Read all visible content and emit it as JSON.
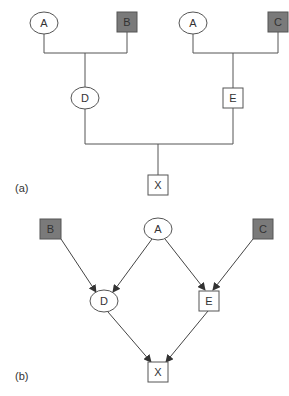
{
  "diagram_a": {
    "caption": "(a)",
    "nodes": {
      "a1": {
        "label": "A",
        "shape": "ellipse",
        "fill": "#ffffff"
      },
      "b": {
        "label": "B",
        "shape": "box",
        "fill": "#7a7a7a"
      },
      "a2": {
        "label": "A",
        "shape": "ellipse",
        "fill": "#ffffff"
      },
      "c": {
        "label": "C",
        "shape": "box",
        "fill": "#7a7a7a"
      },
      "d": {
        "label": "D",
        "shape": "ellipse",
        "fill": "#ffffff"
      },
      "e": {
        "label": "E",
        "shape": "box",
        "fill": "#ffffff"
      },
      "x": {
        "label": "X",
        "shape": "box",
        "fill": "#ffffff"
      }
    },
    "edges": [
      [
        "A",
        "D"
      ],
      [
        "B",
        "D"
      ],
      [
        "A",
        "E"
      ],
      [
        "C",
        "E"
      ],
      [
        "D",
        "X"
      ],
      [
        "E",
        "X"
      ]
    ]
  },
  "diagram_b": {
    "caption": "(b)",
    "nodes": {
      "b": {
        "label": "B",
        "shape": "box",
        "fill": "#7a7a7a"
      },
      "a": {
        "label": "A",
        "shape": "ellipse",
        "fill": "#ffffff"
      },
      "c": {
        "label": "C",
        "shape": "box",
        "fill": "#7a7a7a"
      },
      "d": {
        "label": "D",
        "shape": "ellipse",
        "fill": "#ffffff"
      },
      "e": {
        "label": "E",
        "shape": "box",
        "fill": "#ffffff"
      },
      "x": {
        "label": "X",
        "shape": "box",
        "fill": "#ffffff"
      }
    },
    "edges": [
      [
        "B",
        "D"
      ],
      [
        "A",
        "D"
      ],
      [
        "A",
        "E"
      ],
      [
        "C",
        "E"
      ],
      [
        "D",
        "X"
      ],
      [
        "E",
        "X"
      ]
    ]
  }
}
